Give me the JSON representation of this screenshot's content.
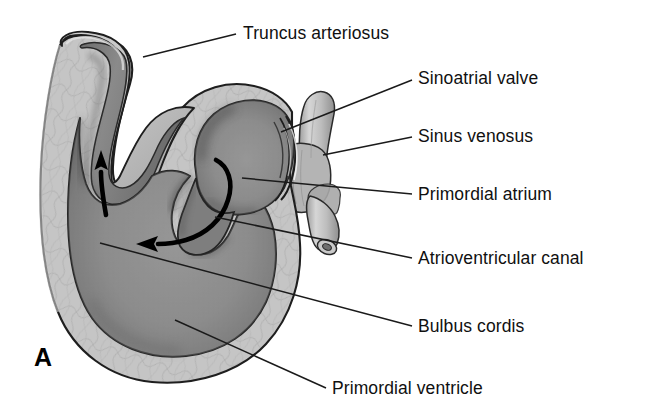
{
  "figure": {
    "panel_letter": "A",
    "background_color": "#ffffff",
    "labels": [
      {
        "id": "truncus-arteriosus",
        "text": "Truncus arteriosus",
        "x": 243,
        "y": 25,
        "leader": {
          "x1": 143,
          "y1": 57,
          "x2": 236,
          "y2": 34
        }
      },
      {
        "id": "sinoatrial-valve",
        "text": "Sinoatrial valve",
        "x": 418,
        "y": 70,
        "leader": {
          "x1": 281,
          "y1": 132,
          "x2": 412,
          "y2": 80
        }
      },
      {
        "id": "sinus-venosus",
        "text": "Sinus venosus",
        "x": 418,
        "y": 128,
        "leader": {
          "x1": 323,
          "y1": 155,
          "x2": 412,
          "y2": 137
        }
      },
      {
        "id": "primordial-atrium",
        "text": "Primordial atrium",
        "x": 418,
        "y": 186,
        "leader": {
          "x1": 242,
          "y1": 178,
          "x2": 412,
          "y2": 194
        }
      },
      {
        "id": "atrioventricular-canal",
        "text": "Atrioventricular canal",
        "x": 418,
        "y": 250,
        "leader": {
          "x1": 215,
          "y1": 217,
          "x2": 412,
          "y2": 258
        }
      },
      {
        "id": "bulbus-cordis",
        "text": "Bulbus cordis",
        "x": 418,
        "y": 318,
        "leader": {
          "x1": 100,
          "y1": 243,
          "x2": 412,
          "y2": 326
        }
      },
      {
        "id": "primordial-ventricle",
        "text": "Primordial ventricle",
        "x": 332,
        "y": 380,
        "leader": {
          "x1": 175,
          "y1": 320,
          "x2": 326,
          "y2": 388
        }
      }
    ],
    "flow_arrows": [
      {
        "id": "ventricle-to-bulbus-arrow",
        "direction": "up",
        "description": "blood flow ascending through bulbus cordis"
      },
      {
        "id": "atrium-to-ventricle-arrow",
        "direction": "left",
        "description": "blood flow through atrioventricular canal into ventricle"
      }
    ],
    "colors": {
      "myocardium_wall": "#c3c3c3",
      "lumen_cavity": "#8d8d8d",
      "lumen_shadow": "#5a5a5a",
      "vessel_highlight": "#d8d8d8",
      "outline": "#1a1a1a",
      "leader_line": "#1a1a1a",
      "text": "#101010"
    }
  }
}
